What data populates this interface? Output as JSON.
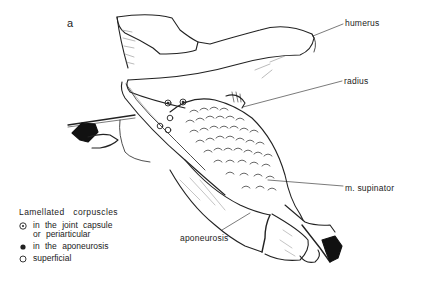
{
  "figure": {
    "panel_letter": "a",
    "labels": {
      "humerus": "humerus",
      "radius": "radius",
      "supinator": "m. supinator",
      "aponeurosis": "aponeurosis"
    },
    "legend": {
      "title": "Lamellated  corpuscles",
      "items": [
        {
          "symbol": "circle-dot",
          "text_line1": "in the joint capsule",
          "text_line2": "or periarticular"
        },
        {
          "symbol": "filled-dot",
          "text_line1": "in the aponeurosis"
        },
        {
          "symbol": "open-circle",
          "text_line1": "superficial"
        }
      ]
    },
    "colors": {
      "ink": "#222222",
      "background": "#ffffff"
    }
  }
}
